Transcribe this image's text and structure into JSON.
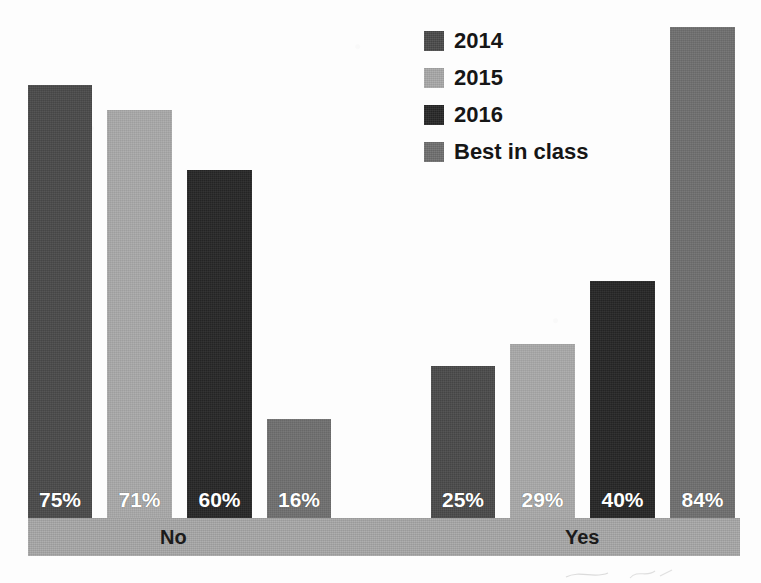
{
  "chart_data": {
    "type": "bar",
    "title": "",
    "subtitle": "",
    "xlabel": "",
    "ylabel": "",
    "ylim": [
      0,
      100
    ],
    "grid": false,
    "legend_position": "top-center",
    "orientation": "vertical",
    "grouped": true,
    "categories": [
      "No",
      "Yes"
    ],
    "series": [
      {
        "name": "2014",
        "color": "#4a4a4a",
        "values": [
          75,
          25
        ],
        "labels": [
          "75%",
          "25%"
        ]
      },
      {
        "name": "2015",
        "color": "#a9a9a9",
        "values": [
          71,
          29
        ],
        "labels": [
          "71%",
          "29%"
        ]
      },
      {
        "name": "2016",
        "color": "#262626",
        "values": [
          60,
          40
        ],
        "labels": [
          "60%",
          "40%"
        ]
      },
      {
        "name": "Best in class",
        "color": "#6f6f6f",
        "values": [
          16,
          84
        ],
        "labels": [
          "16%",
          "84%"
        ]
      }
    ],
    "bars": [
      {
        "group": "No",
        "series": "2014",
        "value": 75,
        "label": "75%",
        "color": "#4a4a4a",
        "x": 28,
        "width": 64,
        "top": 85
      },
      {
        "group": "No",
        "series": "2015",
        "value": 71,
        "label": "71%",
        "color": "#a9a9a9",
        "x": 107,
        "width": 65,
        "top": 110
      },
      {
        "group": "No",
        "series": "2016",
        "value": 60,
        "label": "60%",
        "color": "#262626",
        "x": 187,
        "width": 65,
        "top": 170
      },
      {
        "group": "No",
        "series": "Best in class",
        "value": 16,
        "label": "16%",
        "color": "#6f6f6f",
        "x": 267,
        "width": 64,
        "top": 419
      },
      {
        "group": "Yes",
        "series": "2014",
        "value": 25,
        "label": "25%",
        "color": "#4a4a4a",
        "x": 431,
        "width": 64,
        "top": 366
      },
      {
        "group": "Yes",
        "series": "2015",
        "value": 29,
        "label": "29%",
        "color": "#a9a9a9",
        "x": 510,
        "width": 65,
        "top": 344
      },
      {
        "group": "Yes",
        "series": "2016",
        "value": 40,
        "label": "40%",
        "color": "#262626",
        "x": 590,
        "width": 65,
        "top": 281
      },
      {
        "group": "Yes",
        "series": "Best in class",
        "value": 84,
        "label": "84%",
        "color": "#6f6f6f",
        "x": 670,
        "width": 65,
        "top": 27
      }
    ],
    "axis_band": {
      "color": "#a8a8a8",
      "ticks": [
        {
          "label": "No",
          "x": 160
        },
        {
          "label": "Yes",
          "x": 565
        }
      ]
    },
    "legend": {
      "entries": [
        {
          "label": "2014",
          "color": "#4a4a4a"
        },
        {
          "label": "2015",
          "color": "#a9a9a9"
        },
        {
          "label": "2016",
          "color": "#262626"
        },
        {
          "label": "Best in class",
          "color": "#6f6f6f"
        }
      ]
    }
  },
  "colors": {
    "background": "#fdfdfd",
    "axis_band": "#a8a8a8",
    "value_text": "#ffffff",
    "label_text": "#1b1b1b",
    "series_2014": "#4a4a4a",
    "series_2015": "#a9a9a9",
    "series_2016": "#262626",
    "series_best_in_class": "#6f6f6f"
  }
}
